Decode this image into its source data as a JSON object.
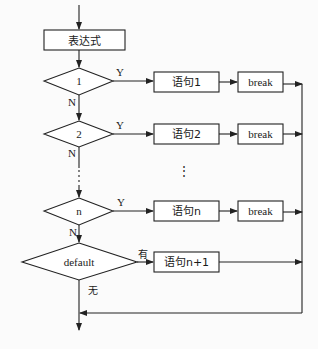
{
  "diagram": {
    "type": "flowchart",
    "title": "",
    "colors": {
      "stroke": "#222222",
      "text": "#1a1a1a",
      "background": "#fbfbfb"
    },
    "start": {
      "label": "表达式"
    },
    "cases": [
      {
        "id": "case-1",
        "condition": "1",
        "yes_label": "Y",
        "no_label": "N",
        "statement": "语句1",
        "break": "break"
      },
      {
        "id": "case-2",
        "condition": "2",
        "yes_label": "Y",
        "no_label": "N",
        "statement": "语句2",
        "break": "break"
      },
      {
        "id": "case-n",
        "condition": "n",
        "yes_label": "Y",
        "no_label": "N",
        "statement": "语句n",
        "break": "break"
      }
    ],
    "ellipsis": "⋮",
    "default": {
      "condition": "default",
      "yes_label": "有",
      "no_label": "无",
      "statement": "语句n+1"
    }
  }
}
